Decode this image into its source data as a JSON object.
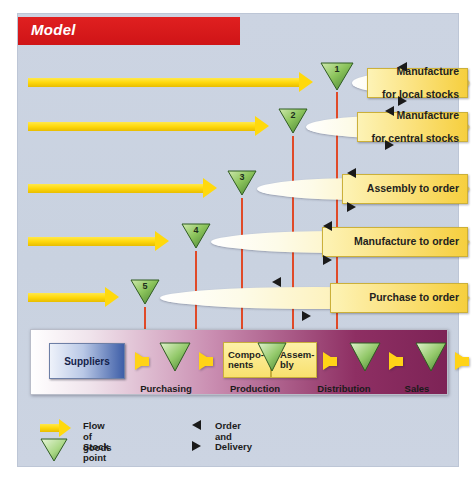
{
  "title": "Model",
  "diagram": {
    "type": "supply-chain-decoupling-point",
    "background_color": "#ccd4e2",
    "title_bar_color": "#cf1417",
    "flow_color": "#ffd90d",
    "stock_point_color": "#7fc24a",
    "connector_color": "#e04a28",
    "rows": [
      {
        "number": "1",
        "strategy": "Manufacture",
        "strategy2": "for local stocks",
        "stock_point_x": 337,
        "flow_end_x": 305,
        "lens_start_x": 352
      },
      {
        "number": "2",
        "strategy": "Manufacture",
        "strategy2": "for central stocks",
        "stock_point_x": 293,
        "flow_end_x": 261,
        "lens_start_x": 306
      },
      {
        "number": "3",
        "strategy": "Assembly to order",
        "strategy2": "",
        "stock_point_x": 242,
        "flow_end_x": 212,
        "lens_start_x": 257
      },
      {
        "number": "4",
        "strategy": "Manufacture to order",
        "strategy2": "",
        "stock_point_x": 196,
        "flow_end_x": 165,
        "lens_start_x": 211
      },
      {
        "number": "5",
        "strategy": "Purchase to order",
        "strategy2": "",
        "stock_point_x": 145,
        "flow_end_x": 115,
        "lens_start_x": 160
      }
    ],
    "process_band": {
      "start_node": "Suppliers",
      "end_node": "Customers",
      "inner_boxes": [
        "Compo-",
        "nents",
        "Assem-",
        "bly"
      ],
      "components_label_line1": "Compo-",
      "components_label_line2": "nents",
      "assembly_label_line1": "Assem-",
      "assembly_label_line2": "bly",
      "stages": [
        "Purchasing",
        "Production",
        "Distribution",
        "Sales"
      ]
    },
    "legend": {
      "flow_of_goods": "Flow of goods",
      "stock_point": "Stock point",
      "order": "Order and",
      "delivery": "Delivery"
    }
  }
}
